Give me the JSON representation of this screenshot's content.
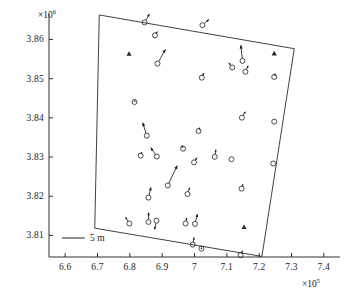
{
  "chart_data": {
    "type": "scatter",
    "title": "",
    "subtitle": "",
    "xlabel": "",
    "ylabel": "",
    "x_exponent_label": "×10",
    "x_exponent_power": "5",
    "y_exponent_label": "×10",
    "y_exponent_power": "6",
    "xlim": [
      6.55,
      7.45
    ],
    "ylim": [
      3.8045,
      3.8665
    ],
    "xticks": [
      "6.6",
      "6.7",
      "6.8",
      "6.9",
      "7",
      "7.1",
      "7.2",
      "7.3",
      "7.4"
    ],
    "xtick_values": [
      6.6,
      6.7,
      6.8,
      6.9,
      7.0,
      7.1,
      7.2,
      7.3,
      7.4
    ],
    "yticks": [
      "3.86",
      "3.85",
      "3.84",
      "3.83",
      "3.82",
      "3.81"
    ],
    "ytick_values": [
      3.86,
      3.85,
      3.84,
      3.83,
      3.82,
      3.81
    ],
    "grid": false,
    "legend_position": "none",
    "scale_bar": {
      "label": "5 m",
      "length_data_x": 0.07
    },
    "boundary_polygon": {
      "name": "survey-area-boundary",
      "points": [
        [
          6.7055,
          3.86625
        ],
        [
          7.3085,
          3.85765
        ],
        [
          7.2085,
          3.80465
        ],
        [
          6.6915,
          3.81185
        ]
      ]
    },
    "series": [
      {
        "name": "displacement-vectors",
        "marker": "open-circle",
        "points": [
          {
            "x": 6.8455,
            "y": 3.86435,
            "u": 0.0145,
            "v": 0.00205
          },
          {
            "x": 6.8775,
            "y": 3.86105,
            "u": 0.0075,
            "v": 0.00095
          },
          {
            "x": 7.0245,
            "y": 3.86365,
            "u": 0.019,
            "v": 0.0014
          },
          {
            "x": 6.8855,
            "y": 3.85385,
            "u": 0.0235,
            "v": 0.00345
          },
          {
            "x": 7.1485,
            "y": 3.85455,
            "u": -0.005,
            "v": 0.0038
          },
          {
            "x": 7.1165,
            "y": 3.85285,
            "u": -0.01,
            "v": 0.00115
          },
          {
            "x": 7.1575,
            "y": 3.85175,
            "u": 0.008,
            "v": 0.0015
          },
          {
            "x": 7.2465,
            "y": 3.85045,
            "u": 0.003,
            "v": 0.00085
          },
          {
            "x": 7.0225,
            "y": 3.85025,
            "u": 0.006,
            "v": 0.0011
          },
          {
            "x": 6.8145,
            "y": 3.84405,
            "u": 0.002,
            "v": 0.00055
          },
          {
            "x": 7.1465,
            "y": 3.84005,
            "u": 0.0105,
            "v": 0.00145
          },
          {
            "x": 7.2465,
            "y": 3.83905,
            "u": 0.001,
            "v": 0.0002
          },
          {
            "x": 7.0125,
            "y": 3.83665,
            "u": 0.0035,
            "v": 0.00085
          },
          {
            "x": 6.8525,
            "y": 3.83545,
            "u": -0.012,
            "v": 0.00315
          },
          {
            "x": 6.9645,
            "y": 3.83215,
            "u": -0.003,
            "v": 0.0008
          },
          {
            "x": 6.8335,
            "y": 3.83035,
            "u": 0.0035,
            "v": 0.0009
          },
          {
            "x": 6.8835,
            "y": 3.83015,
            "u": -0.018,
            "v": 0.00215
          },
          {
            "x": 7.0625,
            "y": 3.83005,
            "u": 0.0035,
            "v": 0.00175
          },
          {
            "x": 7.1145,
            "y": 3.82945,
            "u": 0.0012,
            "v": 0.00025
          },
          {
            "x": 7.2435,
            "y": 3.82835,
            "u": 0.001,
            "v": 0.0002
          },
          {
            "x": 6.9985,
            "y": 3.82865,
            "u": 0.0085,
            "v": 0.00115
          },
          {
            "x": 6.9175,
            "y": 3.82275,
            "u": 0.0275,
            "v": 0.0048
          },
          {
            "x": 7.1455,
            "y": 3.82195,
            "u": 0.0045,
            "v": 0.00105
          },
          {
            "x": 6.9785,
            "y": 3.82055,
            "u": 0.0065,
            "v": 0.0016
          },
          {
            "x": 6.8575,
            "y": 3.81965,
            "u": 0.0075,
            "v": 0.0025
          },
          {
            "x": 6.8825,
            "y": 3.81375,
            "u": -0.0055,
            "v": -0.0021
          },
          {
            "x": 6.8575,
            "y": 3.81345,
            "u": 0.0005,
            "v": 0.0023
          },
          {
            "x": 6.7985,
            "y": 3.81305,
            "u": -0.0115,
            "v": 0.00155
          },
          {
            "x": 6.9725,
            "y": 3.81305,
            "u": 0.0035,
            "v": 0.00135
          },
          {
            "x": 7.0015,
            "y": 3.81295,
            "u": 0.0075,
            "v": 0.0024
          },
          {
            "x": 6.9945,
            "y": 3.80765,
            "u": 0.004,
            "v": 0.00175
          },
          {
            "x": 7.0215,
            "y": 3.80665,
            "u": 0.0015,
            "v": 0.0004
          },
          {
            "x": 7.1425,
            "y": 3.80495,
            "u": 0.0055,
            "v": 0.0011
          }
        ]
      },
      {
        "name": "reference-stations",
        "marker": "filled-triangle",
        "points": [
          {
            "x": 6.7975,
            "y": 3.85635
          },
          {
            "x": 7.2465,
            "y": 3.85645
          },
          {
            "x": 7.1535,
            "y": 3.81215
          }
        ]
      }
    ]
  },
  "figure": {
    "background_color": "#ffffff",
    "axis_color": "#333333",
    "marker_color": "#2b2b2b",
    "vector_color": "#111111",
    "boundary_color": "#2b2b2b"
  }
}
